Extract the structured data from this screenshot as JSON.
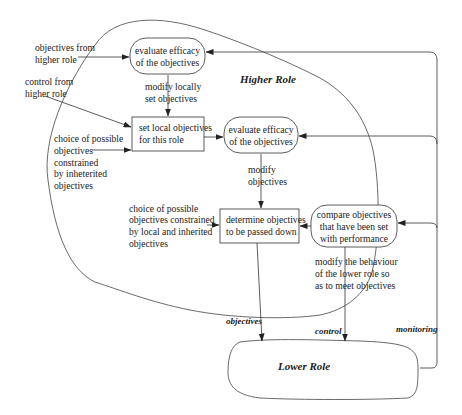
{
  "diagram": {
    "regions": {
      "higher_role": "Higher Role",
      "lower_role": "Lower Role"
    },
    "nodes": {
      "evaluate_top": [
        "evaluate efficacy",
        "of the objectives"
      ],
      "set_local": [
        "set local objectives",
        "for this role"
      ],
      "evaluate_mid": [
        "evaluate efficacy",
        "of the objectives"
      ],
      "determine": [
        "determine objectives",
        "to be passed down"
      ],
      "compare": [
        "compare objectives",
        "that have been set",
        "with performance"
      ]
    },
    "labels": {
      "objectives_from_higher": [
        "objectives from",
        "higher role"
      ],
      "control_from_higher": [
        "control from",
        "higher role"
      ],
      "modify_locally": [
        "modify locally",
        "set objectives"
      ],
      "choice_inherited": [
        "choice of possible",
        "objectives",
        "constrained",
        "by inheterited",
        "objectives"
      ],
      "modify_objectives": [
        "modify",
        "objectives"
      ],
      "choice_local_inherited": [
        "choice of possible",
        "objectives constrained",
        "by local and inherited",
        "objectives"
      ],
      "modify_behaviour": [
        "modify the behaviour",
        "of the lower role so",
        "as to meet objectives"
      ]
    },
    "edges": {
      "objectives": "objectives",
      "control": "control",
      "monitoring": "monitoring"
    }
  }
}
